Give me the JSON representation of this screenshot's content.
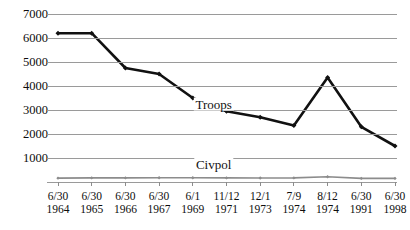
{
  "chart_data": {
    "type": "line",
    "title": "",
    "xlabel": "",
    "ylabel": "",
    "ylim": [
      0,
      7000
    ],
    "ytick_values": [
      7000,
      6000,
      5000,
      4000,
      3000,
      2000,
      1000
    ],
    "ytick_labels": [
      "7000",
      "6000",
      "5000",
      "4000",
      "3000",
      "2000",
      "1000"
    ],
    "grid": true,
    "legend": "inline-labels",
    "categories": [
      "6/30 1964",
      "6/30 1965",
      "6/30 1966",
      "6/30 1967",
      "6/1 1969",
      "11/12 1971",
      "12/1 1973",
      "7/9 1974",
      "8/12 1974",
      "6/30 1991",
      "6/30 1998"
    ],
    "x_tick_lines_1": [
      "6/30",
      "6/30",
      "6/30",
      "6/30",
      "6/1",
      "11/12",
      "12/1",
      "7/9",
      "8/12",
      "6/30",
      "6/30"
    ],
    "x_tick_lines_2": [
      "1964",
      "1965",
      "1966",
      "1967",
      "1969",
      "1971",
      "1973",
      "1974",
      "1974",
      "1991",
      "1998"
    ],
    "series": [
      {
        "name": "Troops",
        "color": "#111111",
        "values": [
          6200,
          6200,
          4750,
          4500,
          3500,
          2950,
          2700,
          2350,
          4350,
          2300,
          1500
        ]
      },
      {
        "name": "Civpol",
        "color": "#8c8c8c",
        "values": [
          160,
          170,
          170,
          175,
          175,
          170,
          165,
          170,
          220,
          150,
          150
        ]
      }
    ],
    "annotations": [
      {
        "text": "Troops",
        "x_fraction": 0.476,
        "y_value": 3260
      },
      {
        "text": "Civpol",
        "x_fraction": 0.476,
        "y_value": 750
      }
    ]
  }
}
